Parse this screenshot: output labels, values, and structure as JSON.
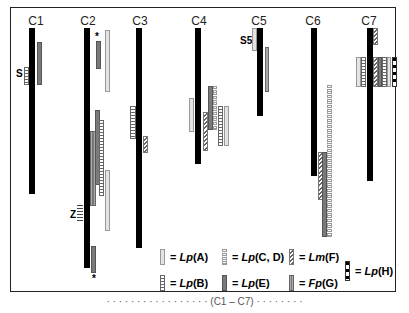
{
  "figure": {
    "chromosome_labels": [
      "C1",
      "C2",
      "C3",
      "C4",
      "C5",
      "C6",
      "C7"
    ],
    "annotations": {
      "c1_marker": "S",
      "c2_asterisk_top": "*",
      "c2_marker": "Z",
      "c2_asterisk_bottom": "*",
      "c5_marker": "S5"
    },
    "legend": [
      {
        "symbol": "light-gray-bar",
        "eq": "=",
        "species": "Lp",
        "group": "(A)"
      },
      {
        "symbol": "ladder-bar",
        "eq": "=",
        "species": "Lp",
        "group": "(B)"
      },
      {
        "symbol": "dotted-bar",
        "eq": "=",
        "species": "Lp",
        "group": "(C, D)"
      },
      {
        "symbol": "dark-gray-bar",
        "eq": "=",
        "species": "Lp",
        "group": "(E)"
      },
      {
        "symbol": "hatched-bar",
        "eq": "=",
        "species": "Lm",
        "group": "(F)"
      },
      {
        "symbol": "striped-gray-bar",
        "eq": "=",
        "species": "Fp",
        "group": "(G)"
      },
      {
        "symbol": "black-dotted-bar",
        "eq": "=",
        "species": "Lp",
        "group": "(H)"
      }
    ],
    "caption_fragment": "· · · · · · · · · · · · · · · · · (C1 – C7) · · · · · · · ·"
  }
}
